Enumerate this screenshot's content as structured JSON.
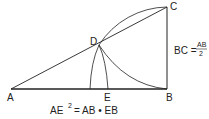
{
  "diagram": {
    "points": {
      "A": {
        "label": "A"
      },
      "B": {
        "label": "B"
      },
      "C": {
        "label": "C"
      },
      "D": {
        "label": "D"
      },
      "E": {
        "label": "E"
      }
    },
    "annotation_bc": {
      "lhs": "BC =",
      "numerator": "AB",
      "denominator": "2"
    },
    "formula": {
      "lhs": "AE",
      "exponent": "2",
      "rhs": "= AB • EB"
    },
    "colors": {
      "stroke": "#222222",
      "background": "#ffffff"
    }
  }
}
